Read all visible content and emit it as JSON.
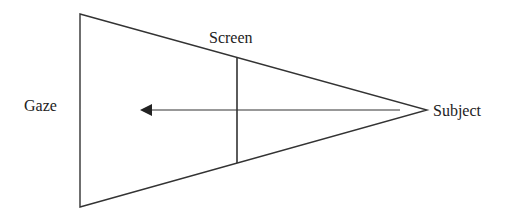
{
  "labels": {
    "gaze": "Gaze",
    "screen": "Screen",
    "subject": "Subject"
  },
  "colors": {
    "line": "#333333",
    "text": "#222222",
    "background": "#ffffff"
  },
  "geometry": {
    "triangle": {
      "left_x": 80,
      "top_y": 14,
      "bottom_y": 207,
      "apex_x": 427,
      "apex_y": 110
    },
    "screen_line": {
      "x": 237,
      "y1": 58,
      "y2": 163
    },
    "arrow": {
      "from_x": 400,
      "to_x": 140,
      "y": 110
    }
  }
}
